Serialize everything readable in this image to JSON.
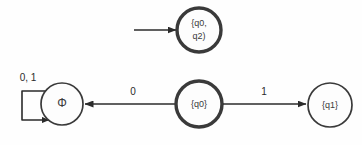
{
  "diagram": {
    "background_color": "#fefefe",
    "stroke_color": "#3a3a3a",
    "text_color": "#2b2b2b",
    "states": [
      {
        "id": "q0q2",
        "label_line1": "{q0,",
        "label_line2": "q2)",
        "border": "thick",
        "cx": 199,
        "cy": 30,
        "r": 22
      },
      {
        "id": "phi",
        "label": "Φ",
        "border": "thin",
        "cx": 62,
        "cy": 104,
        "r": 21
      },
      {
        "id": "q0",
        "label": "{q0}",
        "border": "thick",
        "cx": 199,
        "cy": 104,
        "r": 23
      },
      {
        "id": "q1",
        "label": "{q1}",
        "border": "thin",
        "cx": 330,
        "cy": 105,
        "r": 22
      }
    ],
    "transitions": [
      {
        "id": "start-to-q0q2",
        "from": "start",
        "to": "q0q2",
        "label": ""
      },
      {
        "id": "phi-self-loop",
        "from": "phi",
        "to": "phi",
        "label": "0, 1"
      },
      {
        "id": "q0-to-phi",
        "from": "q0",
        "to": "phi",
        "label": "0"
      },
      {
        "id": "q0-to-q1",
        "from": "q0",
        "to": "q1",
        "label": "1"
      }
    ]
  }
}
